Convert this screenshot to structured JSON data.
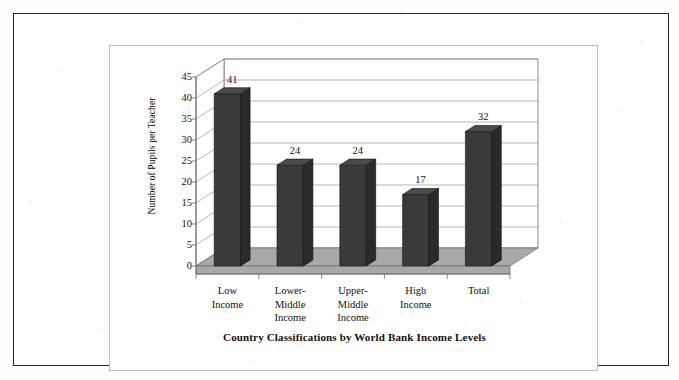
{
  "figure": {
    "title": "Country Classifications by World Bank Income Levels",
    "y_axis_title": "Number of Pupils per Teacher"
  },
  "chart_data": {
    "type": "bar",
    "title": "Country Classifications by World Bank Income Levels",
    "xlabel": "Country Classifications by World Bank Income Levels",
    "ylabel": "Number of Pupils per Teacher",
    "categories": [
      "Low Income",
      "Lower-Middle Income",
      "Upper-Middle Income",
      "High Income",
      "Total"
    ],
    "category_lines": [
      [
        "Low",
        "Income"
      ],
      [
        "Lower-",
        "Middle",
        "Income"
      ],
      [
        "Upper-",
        "Middle",
        "Income"
      ],
      [
        "High",
        "Income"
      ],
      [
        "Total"
      ]
    ],
    "values": [
      41,
      24,
      24,
      17,
      32
    ],
    "value_labels": [
      "41",
      "24",
      "24",
      "17",
      "32"
    ],
    "ylim": [
      0,
      45
    ],
    "ytick_values": [
      45,
      40,
      35,
      30,
      25,
      20,
      15,
      10,
      5,
      0
    ],
    "ytick_labels": [
      "45",
      "40",
      "35",
      "30",
      "25",
      "20",
      "15",
      "10",
      "5",
      "0"
    ],
    "grid": true,
    "legend": null,
    "style": "3d-column",
    "colors": {
      "bar_front": "#3a3a3a",
      "bar_side": "#2a2a2a",
      "bar_top": "#4a4a4a",
      "floor": "#a8a8a8",
      "wall": "#ffffff",
      "gridline": "#9a9a9a",
      "axis": "#6e6e6e",
      "text": "#111111",
      "page_border": "#24292c",
      "figure_border": "#bdbdbd",
      "background": "#ffffff"
    }
  }
}
